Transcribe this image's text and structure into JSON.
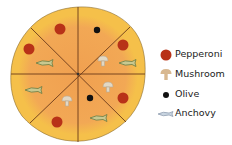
{
  "diagram": {
    "slices": 8,
    "colors": {
      "crust": "#f5c04a",
      "sauce": "#f0a055",
      "cut": "#6b3a1a",
      "pepperoni": "#b83218",
      "mushroom": "#d9cfb8",
      "olive": "#111111",
      "anchovy": "#c8c890"
    }
  },
  "legend": {
    "items": [
      {
        "label": "Pepperoni",
        "icon": "pepperoni-icon"
      },
      {
        "label": "Mushroom",
        "icon": "mushroom-icon"
      },
      {
        "label": "Olive",
        "icon": "olive-icon"
      },
      {
        "label": "Anchovy",
        "icon": "anchovy-icon"
      }
    ]
  }
}
